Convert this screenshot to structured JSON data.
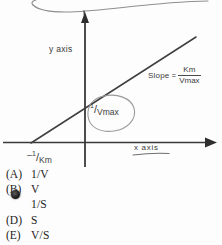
{
  "figure": {
    "type": "lineweaver-burk-plot",
    "y_axis_label": "y axis",
    "x_axis_label": "x axis",
    "slope": {
      "lhs": "Slope",
      "equals": "=",
      "numerator": "Km",
      "denominator": "Vmax"
    },
    "x_intercept": {
      "minus": "–",
      "numerator": "1",
      "slash": "/",
      "denominator": "Km"
    },
    "y_intercept": {
      "numerator": "1",
      "slash": "/",
      "denominator": "Vmax"
    },
    "annotations": {
      "y_intercept_circled": true,
      "x_axis_underlined": true,
      "top_squiggle": true
    },
    "ink_color": "#3c3c3c",
    "pencil_color": "#8a8a8a"
  },
  "choices": [
    {
      "letter": "(A)",
      "text": "1/V",
      "marked": false
    },
    {
      "letter": "(B)",
      "text": "V",
      "marked": false
    },
    {
      "letter": "(C)",
      "text": "1/S",
      "marked": true
    },
    {
      "letter": "(D)",
      "text": "S",
      "marked": false
    },
    {
      "letter": "(E)",
      "text": "V/S",
      "marked": false
    }
  ]
}
